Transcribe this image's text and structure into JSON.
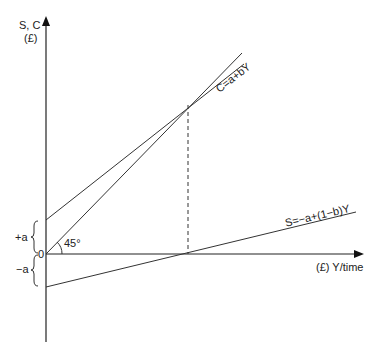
{
  "diagram": {
    "y_axis_label_line1": "S, C",
    "y_axis_label_line2": "(£)",
    "x_axis_label": "(£) Y/time",
    "origin_label": "0",
    "angle_label": "45°",
    "plus_a_label": "+a",
    "minus_a_label": "−a",
    "consumption_label": "C=a+bY",
    "saving_label": "S=−a+(1−b)Y",
    "line_color": "#333333",
    "axis_color": "#222222"
  }
}
